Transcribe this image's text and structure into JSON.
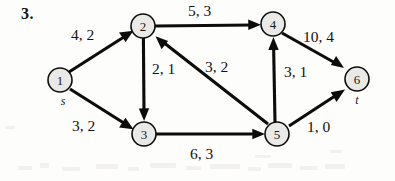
{
  "figure": {
    "problem_number": "3.",
    "type": "flow-network-diagram",
    "label_format": "capacity, flow",
    "nodes": [
      {
        "id": "1",
        "label": "1",
        "terminal": "s",
        "cx": 60,
        "cy": 80,
        "r": 12
      },
      {
        "id": "2",
        "label": "2",
        "terminal": "",
        "cx": 143,
        "cy": 26,
        "r": 12
      },
      {
        "id": "3",
        "label": "3",
        "terminal": "",
        "cx": 144,
        "cy": 134,
        "r": 12
      },
      {
        "id": "4",
        "label": "4",
        "terminal": "",
        "cx": 273,
        "cy": 24,
        "r": 12
      },
      {
        "id": "5",
        "label": "5",
        "terminal": "",
        "cx": 277,
        "cy": 134,
        "r": 12
      },
      {
        "id": "6",
        "label": "6",
        "terminal": "t",
        "cx": 357,
        "cy": 79,
        "r": 12
      }
    ],
    "edges": [
      {
        "from": "1",
        "to": "2",
        "capacity": 4,
        "flow": 2,
        "label": "4, 2",
        "lx": 71,
        "ly": 40
      },
      {
        "from": "1",
        "to": "3",
        "capacity": 3,
        "flow": 2,
        "label": "3, 2",
        "lx": 72,
        "ly": 131
      },
      {
        "from": "2",
        "to": "4",
        "capacity": 5,
        "flow": 3,
        "label": "5, 3",
        "lx": 188,
        "ly": 16
      },
      {
        "from": "2",
        "to": "3",
        "capacity": 2,
        "flow": 1,
        "label": "2, 1",
        "lx": 152,
        "ly": 74
      },
      {
        "from": "5",
        "to": "2",
        "capacity": 3,
        "flow": 2,
        "label": "3, 2",
        "lx": 205,
        "ly": 72
      },
      {
        "from": "3",
        "to": "5",
        "capacity": 6,
        "flow": 3,
        "label": "6, 3",
        "lx": 190,
        "ly": 159
      },
      {
        "from": "5",
        "to": "4",
        "capacity": 3,
        "flow": 1,
        "label": "3, 1",
        "lx": 284,
        "ly": 77
      },
      {
        "from": "4",
        "to": "6",
        "capacity": 10,
        "flow": 4,
        "label": "10, 4",
        "lx": 303,
        "ly": 42
      },
      {
        "from": "5",
        "to": "6",
        "capacity": 1,
        "flow": 0,
        "label": "1, 0",
        "lx": 307,
        "ly": 132
      }
    ],
    "colors": {
      "ink": "#0d0c0b",
      "node_fill": "#e9e9e7",
      "page": "#fdfdfc"
    }
  }
}
